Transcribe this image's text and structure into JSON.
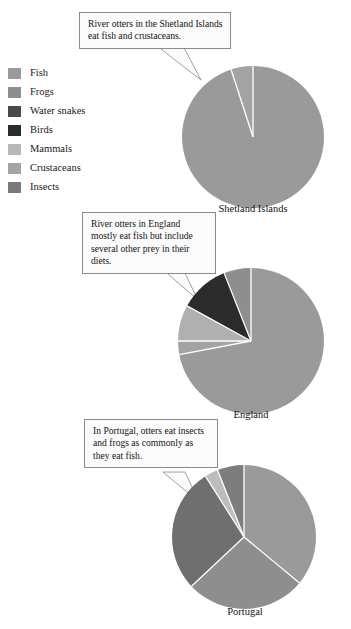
{
  "legend": {
    "items": [
      {
        "label": "Fish",
        "color": "#9a9a9a"
      },
      {
        "label": "Frogs",
        "color": "#8e8e8e"
      },
      {
        "label": "Water snakes",
        "color": "#4a4a4a"
      },
      {
        "label": "Birds",
        "color": "#2b2b2b"
      },
      {
        "label": "Mammals",
        "color": "#b8b8b8"
      },
      {
        "label": "Crustaceans",
        "color": "#a3a3a3"
      },
      {
        "label": "Insects",
        "color": "#7a7a7a"
      }
    ]
  },
  "callouts": [
    {
      "name": "callout-shetland",
      "text": "River otters in the Shetland Islands eat fish and crustaceans."
    },
    {
      "name": "callout-england",
      "text": "River otters in England mostly eat fish but include several other prey in their diets."
    },
    {
      "name": "callout-portugal",
      "text": "In Portugal, otters eat insects and frogs as commonly as they eat fish."
    }
  ],
  "chart_data": [
    {
      "type": "pie",
      "title": "Shetland Islands",
      "categories": [
        "Fish",
        "Crustaceans"
      ],
      "values": [
        95,
        5
      ],
      "colors": [
        "#9a9a9a",
        "#a3a3a3"
      ],
      "start_angle": 0,
      "legend_position": "left",
      "grid": false
    },
    {
      "type": "pie",
      "title": "England",
      "categories": [
        "Fish",
        "Crustaceans",
        "Mammals",
        "Birds",
        "Frogs"
      ],
      "values": [
        72,
        3,
        8,
        11,
        6
      ],
      "colors": [
        "#9a9a9a",
        "#a3a3a3",
        "#b0b0b0",
        "#2b2b2b",
        "#8e8e8e"
      ],
      "start_angle": 0,
      "legend_position": "left",
      "grid": false
    },
    {
      "type": "pie",
      "title": "Portugal",
      "categories": [
        "Fish",
        "Frogs",
        "Insects",
        "Mammals",
        "Crustaceans"
      ],
      "values": [
        36,
        27,
        28,
        3,
        6
      ],
      "colors": [
        "#9a9a9a",
        "#8e8e8e",
        "#6f6f6f",
        "#bdbdbd",
        "#7d7d7d"
      ],
      "start_angle": 0,
      "legend_position": "left",
      "grid": false
    }
  ],
  "pies": {
    "shetland": {
      "caption": "Shetland Islands"
    },
    "england": {
      "caption": "England"
    },
    "portugal": {
      "caption": "Portugal"
    }
  }
}
